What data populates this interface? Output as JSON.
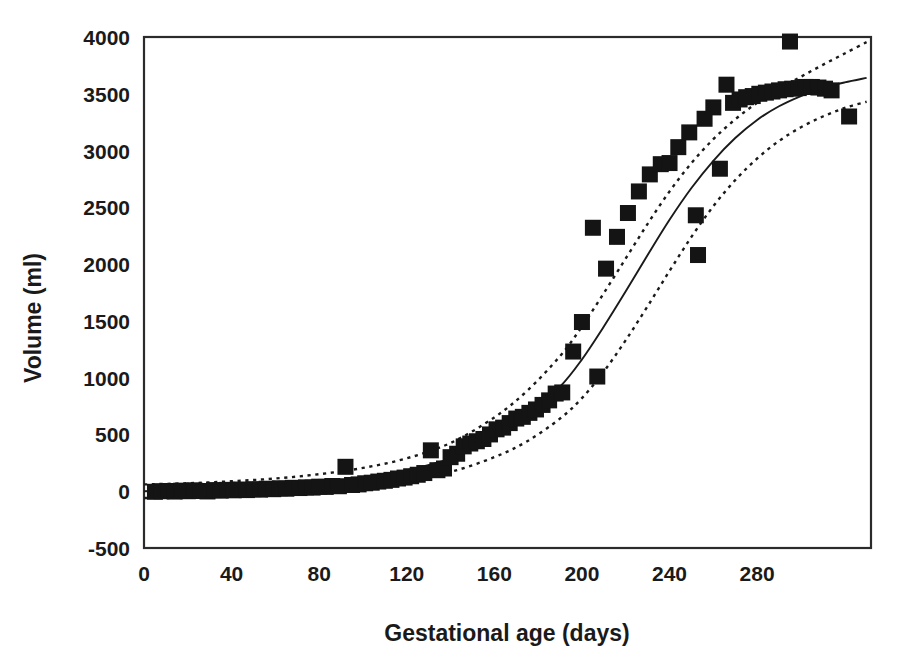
{
  "chart_data": {
    "type": "scatter",
    "title": "",
    "xlabel": "Gestational age (days)",
    "ylabel": "Volume (ml)",
    "xlim": [
      0,
      332
    ],
    "ylim": [
      -500,
      4000
    ],
    "xticks": [
      0,
      40,
      80,
      120,
      160,
      200,
      240,
      280
    ],
    "yticks": [
      -500,
      0,
      500,
      1000,
      1500,
      2000,
      2500,
      3000,
      3500,
      4000
    ],
    "xtick_labels": [
      "0",
      "40",
      "80",
      "120",
      "160",
      "200",
      "240",
      "280"
    ],
    "ytick_labels": [
      "-500",
      "0",
      "500",
      "1000",
      "1500",
      "2000",
      "2500",
      "3000",
      "3500",
      "4000"
    ],
    "grid": false,
    "legend": "none",
    "marker": "filled-square",
    "marker_color": "#141414",
    "frame_color": "#2b2b2b",
    "background": "#ffffff",
    "series": [
      {
        "name": "Observed volume",
        "type": "scatter",
        "points": [
          [
            5,
            -5
          ],
          [
            8,
            0
          ],
          [
            11,
            2
          ],
          [
            14,
            -3
          ],
          [
            17,
            5
          ],
          [
            20,
            0
          ],
          [
            23,
            8
          ],
          [
            26,
            2
          ],
          [
            29,
            -2
          ],
          [
            32,
            10
          ],
          [
            35,
            5
          ],
          [
            38,
            12
          ],
          [
            41,
            8
          ],
          [
            44,
            15
          ],
          [
            47,
            10
          ],
          [
            50,
            18
          ],
          [
            53,
            14
          ],
          [
            56,
            22
          ],
          [
            59,
            18
          ],
          [
            62,
            26
          ],
          [
            65,
            22
          ],
          [
            68,
            30
          ],
          [
            71,
            28
          ],
          [
            74,
            34
          ],
          [
            77,
            32
          ],
          [
            80,
            40
          ],
          [
            83,
            38
          ],
          [
            86,
            46
          ],
          [
            89,
            44
          ],
          [
            92,
            215
          ],
          [
            95,
            55
          ],
          [
            98,
            60
          ],
          [
            101,
            70
          ],
          [
            104,
            75
          ],
          [
            107,
            85
          ],
          [
            110,
            92
          ],
          [
            113,
            100
          ],
          [
            116,
            112
          ],
          [
            119,
            120
          ],
          [
            122,
            132
          ],
          [
            125,
            145
          ],
          [
            128,
            160
          ],
          [
            131,
            360
          ],
          [
            134,
            185
          ],
          [
            137,
            200
          ],
          [
            140,
            300
          ],
          [
            143,
            330
          ],
          [
            146,
            395
          ],
          [
            149,
            420
          ],
          [
            152,
            440
          ],
          [
            155,
            460
          ],
          [
            158,
            500
          ],
          [
            161,
            545
          ],
          [
            164,
            560
          ],
          [
            167,
            600
          ],
          [
            170,
            640
          ],
          [
            173,
            655
          ],
          [
            176,
            690
          ],
          [
            179,
            720
          ],
          [
            182,
            760
          ],
          [
            185,
            800
          ],
          [
            188,
            860
          ],
          [
            191,
            870
          ],
          [
            196,
            1230
          ],
          [
            200,
            1490
          ],
          [
            205,
            2320
          ],
          [
            207,
            1010
          ],
          [
            211,
            1960
          ],
          [
            216,
            2240
          ],
          [
            221,
            2450
          ],
          [
            226,
            2640
          ],
          [
            231,
            2790
          ],
          [
            236,
            2880
          ],
          [
            240,
            2890
          ],
          [
            244,
            3030
          ],
          [
            249,
            3160
          ],
          [
            252,
            2430
          ],
          [
            253,
            2080
          ],
          [
            256,
            3280
          ],
          [
            260,
            3380
          ],
          [
            263,
            2840
          ],
          [
            266,
            3580
          ],
          [
            269,
            3420
          ],
          [
            272,
            3450
          ],
          [
            275,
            3470
          ],
          [
            278,
            3480
          ],
          [
            281,
            3500
          ],
          [
            284,
            3510
          ],
          [
            287,
            3520
          ],
          [
            290,
            3530
          ],
          [
            293,
            3540
          ],
          [
            295,
            3960
          ],
          [
            296,
            3545
          ],
          [
            299,
            3550
          ],
          [
            302,
            3560
          ],
          [
            305,
            3560
          ],
          [
            308,
            3555
          ],
          [
            311,
            3545
          ],
          [
            314,
            3530
          ],
          [
            322,
            3300
          ]
        ]
      },
      {
        "name": "Fitted curve",
        "type": "line",
        "style": "solid",
        "description": "Gompertz/logistic growth fit of fetal volume on gestational age",
        "points": [
          [
            0,
            0
          ],
          [
            20,
            10
          ],
          [
            40,
            25
          ],
          [
            60,
            45
          ],
          [
            80,
            75
          ],
          [
            100,
            120
          ],
          [
            120,
            185
          ],
          [
            140,
            290
          ],
          [
            160,
            470
          ],
          [
            175,
            660
          ],
          [
            190,
            920
          ],
          [
            200,
            1160
          ],
          [
            210,
            1450
          ],
          [
            220,
            1760
          ],
          [
            230,
            2080
          ],
          [
            240,
            2390
          ],
          [
            250,
            2670
          ],
          [
            260,
            2910
          ],
          [
            270,
            3110
          ],
          [
            280,
            3270
          ],
          [
            290,
            3390
          ],
          [
            300,
            3480
          ],
          [
            310,
            3550
          ],
          [
            320,
            3600
          ],
          [
            330,
            3640
          ]
        ]
      },
      {
        "name": "Upper confidence band",
        "type": "line",
        "style": "dotted",
        "points": [
          [
            0,
            60
          ],
          [
            20,
            70
          ],
          [
            40,
            88
          ],
          [
            60,
            112
          ],
          [
            80,
            150
          ],
          [
            100,
            205
          ],
          [
            120,
            290
          ],
          [
            140,
            425
          ],
          [
            160,
            650
          ],
          [
            175,
            885
          ],
          [
            190,
            1190
          ],
          [
            200,
            1450
          ],
          [
            210,
            1745
          ],
          [
            220,
            2050
          ],
          [
            230,
            2355
          ],
          [
            240,
            2640
          ],
          [
            250,
            2890
          ],
          [
            260,
            3100
          ],
          [
            270,
            3275
          ],
          [
            280,
            3420
          ],
          [
            290,
            3540
          ],
          [
            300,
            3650
          ],
          [
            310,
            3755
          ],
          [
            320,
            3855
          ],
          [
            330,
            3955
          ]
        ]
      },
      {
        "name": "Lower confidence band",
        "type": "line",
        "style": "dotted",
        "points": [
          [
            0,
            -60
          ],
          [
            20,
            -50
          ],
          [
            40,
            -38
          ],
          [
            60,
            -20
          ],
          [
            80,
            5
          ],
          [
            100,
            42
          ],
          [
            120,
            95
          ],
          [
            140,
            170
          ],
          [
            160,
            300
          ],
          [
            175,
            440
          ],
          [
            190,
            640
          ],
          [
            200,
            820
          ],
          [
            210,
            1055
          ],
          [
            220,
            1330
          ],
          [
            230,
            1630
          ],
          [
            240,
            1940
          ],
          [
            250,
            2240
          ],
          [
            260,
            2510
          ],
          [
            270,
            2740
          ],
          [
            280,
            2930
          ],
          [
            290,
            3085
          ],
          [
            300,
            3205
          ],
          [
            310,
            3300
          ],
          [
            320,
            3375
          ],
          [
            330,
            3430
          ]
        ]
      }
    ]
  },
  "axes": {
    "x_title": "Gestational age (days)",
    "y_title": "Volume (ml)"
  }
}
